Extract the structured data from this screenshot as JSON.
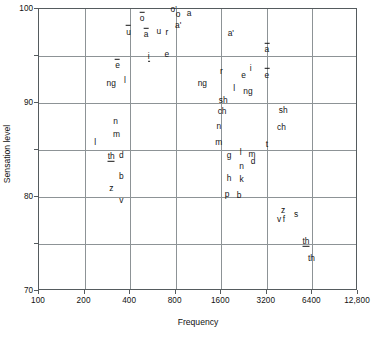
{
  "chart_data": {
    "type": "scatter",
    "title": "",
    "xlabel": "Frequency",
    "ylabel": "Sensation level",
    "xscale": "log2",
    "xlim": [
      100,
      12800
    ],
    "ylim": [
      70,
      100
    ],
    "grid": true,
    "legend": null,
    "xticks": [
      {
        "value": 100,
        "label": "100"
      },
      {
        "value": 200,
        "label": "200"
      },
      {
        "value": 400,
        "label": "400"
      },
      {
        "value": 800,
        "label": "800"
      },
      {
        "value": 1600,
        "label": "1600"
      },
      {
        "value": 3200,
        "label": "3200"
      },
      {
        "value": 6400,
        "label": "6400"
      },
      {
        "value": 12800,
        "label": "12,800"
      }
    ],
    "yticks": [
      {
        "value": 100,
        "label": "100",
        "major": true
      },
      {
        "value": 95,
        "label": "",
        "major": false
      },
      {
        "value": 90,
        "label": "90",
        "major": true
      },
      {
        "value": 85,
        "label": "",
        "major": false
      },
      {
        "value": 80,
        "label": "80",
        "major": true
      },
      {
        "value": 75,
        "label": "",
        "major": false
      },
      {
        "value": 70,
        "label": "70",
        "major": true
      }
    ],
    "points": [
      {
        "label": "o'",
        "x": 775,
        "y": 100.0,
        "style": "plain"
      },
      {
        "label": "o",
        "x": 830,
        "y": 99.5,
        "style": "plain"
      },
      {
        "label": "a",
        "x": 980,
        "y": 99.6,
        "style": "plain"
      },
      {
        "label": "o",
        "x": 480,
        "y": 99.0,
        "style": "macron"
      },
      {
        "label": "a'",
        "x": 830,
        "y": 98.3,
        "style": "plain"
      },
      {
        "label": "u",
        "x": 390,
        "y": 97.6,
        "style": "macron"
      },
      {
        "label": "a",
        "x": 510,
        "y": 97.3,
        "style": "macron"
      },
      {
        "label": "u",
        "x": 620,
        "y": 97.7,
        "style": "plain"
      },
      {
        "label": "r",
        "x": 700,
        "y": 97.6,
        "style": "plain"
      },
      {
        "label": "a'",
        "x": 1850,
        "y": 97.5,
        "style": "plain"
      },
      {
        "label": "a",
        "x": 3200,
        "y": 95.7,
        "style": "macron"
      },
      {
        "label": "i",
        "x": 530,
        "y": 95.0,
        "style": "under"
      },
      {
        "label": "e",
        "x": 700,
        "y": 95.2,
        "style": "plain"
      },
      {
        "label": "e",
        "x": 330,
        "y": 94.0,
        "style": "macron"
      },
      {
        "label": "i",
        "x": 2500,
        "y": 93.7,
        "style": "plain"
      },
      {
        "label": "r",
        "x": 1600,
        "y": 93.4,
        "style": "plain"
      },
      {
        "label": "e",
        "x": 2250,
        "y": 93.0,
        "style": "plain"
      },
      {
        "label": "e",
        "x": 3200,
        "y": 93.0,
        "style": "macron"
      },
      {
        "label": "ng",
        "x": 300,
        "y": 92.1,
        "style": "plain"
      },
      {
        "label": "l",
        "x": 370,
        "y": 92.5,
        "style": "plain"
      },
      {
        "label": "ng",
        "x": 1200,
        "y": 92.1,
        "style": "plain"
      },
      {
        "label": "l",
        "x": 1950,
        "y": 91.6,
        "style": "plain"
      },
      {
        "label": "ng",
        "x": 2400,
        "y": 91.3,
        "style": "plain"
      },
      {
        "label": "sh",
        "x": 1650,
        "y": 90.3,
        "style": "plain"
      },
      {
        "label": "sh",
        "x": 4100,
        "y": 89.3,
        "style": "plain"
      },
      {
        "label": "ch",
        "x": 1620,
        "y": 89.1,
        "style": "plain"
      },
      {
        "label": "n",
        "x": 320,
        "y": 88.1,
        "style": "plain"
      },
      {
        "label": "n",
        "x": 1540,
        "y": 87.6,
        "style": "plain"
      },
      {
        "label": "ch",
        "x": 4000,
        "y": 87.5,
        "style": "plain"
      },
      {
        "label": "m",
        "x": 325,
        "y": 86.7,
        "style": "plain"
      },
      {
        "label": "m",
        "x": 1540,
        "y": 85.9,
        "style": "plain"
      },
      {
        "label": "l",
        "x": 235,
        "y": 85.9,
        "style": "plain"
      },
      {
        "label": "t",
        "x": 3200,
        "y": 85.6,
        "style": "plain"
      },
      {
        "label": "th",
        "x": 300,
        "y": 84.4,
        "style": "under"
      },
      {
        "label": "d",
        "x": 350,
        "y": 84.5,
        "style": "plain"
      },
      {
        "label": "g",
        "x": 1800,
        "y": 84.5,
        "style": "plain"
      },
      {
        "label": "l",
        "x": 2150,
        "y": 84.8,
        "style": "plain"
      },
      {
        "label": "m",
        "x": 2550,
        "y": 84.6,
        "style": "plain"
      },
      {
        "label": "d",
        "x": 2600,
        "y": 83.8,
        "style": "plain"
      },
      {
        "label": "n",
        "x": 2180,
        "y": 83.3,
        "style": "plain"
      },
      {
        "label": "b",
        "x": 350,
        "y": 82.2,
        "style": "plain"
      },
      {
        "label": "h",
        "x": 1800,
        "y": 82.0,
        "style": "plain"
      },
      {
        "label": "k",
        "x": 2180,
        "y": 81.9,
        "style": "plain"
      },
      {
        "label": "z",
        "x": 300,
        "y": 81.0,
        "style": "plain"
      },
      {
        "label": "p",
        "x": 1750,
        "y": 80.3,
        "style": "plain"
      },
      {
        "label": "b",
        "x": 2100,
        "y": 80.2,
        "style": "plain"
      },
      {
        "label": "v",
        "x": 350,
        "y": 79.7,
        "style": "plain"
      },
      {
        "label": "z",
        "x": 4100,
        "y": 78.6,
        "style": "plain"
      },
      {
        "label": "s",
        "x": 5000,
        "y": 78.2,
        "style": "plain"
      },
      {
        "label": "v",
        "x": 3850,
        "y": 77.7,
        "style": "plain"
      },
      {
        "label": "f",
        "x": 4150,
        "y": 77.7,
        "style": "plain"
      },
      {
        "label": "th",
        "x": 5800,
        "y": 75.3,
        "style": "under"
      },
      {
        "label": "th",
        "x": 6300,
        "y": 73.5,
        "style": "plain"
      }
    ]
  }
}
